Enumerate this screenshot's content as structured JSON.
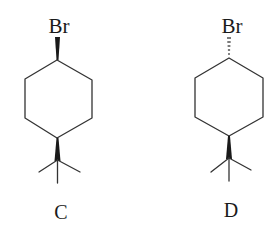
{
  "molecules": [
    {
      "id": "C",
      "label": "C",
      "substituent_top": "Br",
      "top_bond_type": "wedge",
      "bottom_bond_type": "wedge",
      "bottom_group": "tert-butyl",
      "ring": "cyclohexane"
    },
    {
      "id": "D",
      "label": "D",
      "substituent_top": "Br",
      "top_bond_type": "dash",
      "bottom_bond_type": "wedge",
      "bottom_group": "tert-butyl",
      "ring": "cyclohexane"
    }
  ],
  "colors": {
    "ink": "#1a1a1a",
    "bond": "#333333",
    "background": "#ffffff"
  }
}
